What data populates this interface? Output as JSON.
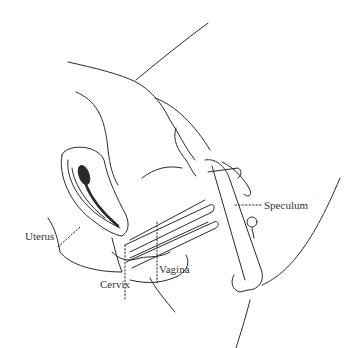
{
  "diagram": {
    "type": "anatomical line drawing",
    "labels": {
      "uterus": "Uterus",
      "cervix": "Cervix",
      "vagina": "Vagina",
      "speculum": "Speculum"
    },
    "colors": {
      "line": "#2a2a2a",
      "background": "#ffffff"
    }
  }
}
